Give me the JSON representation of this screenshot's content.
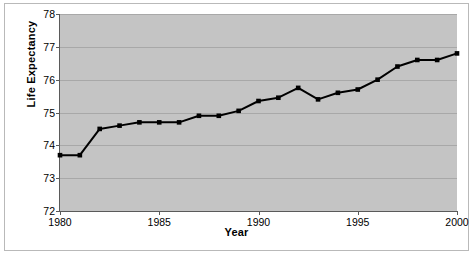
{
  "chart_data": {
    "type": "line",
    "title": "",
    "xlabel": "Year",
    "ylabel": "Life Expectancy",
    "xlim": [
      1980,
      2000
    ],
    "ylim": [
      72,
      78
    ],
    "grid": true,
    "legend": "none",
    "marker": "square",
    "line_color": "#000000",
    "plot_background": "#c4c4c4",
    "gridline_color": "#a8a8a8",
    "x_tick_labels": [
      "1980",
      "1985",
      "1990",
      "1995",
      "2000"
    ],
    "x_tick_values": [
      1980,
      1985,
      1990,
      1995,
      2000
    ],
    "y_tick_labels": [
      "72",
      "73",
      "74",
      "75",
      "76",
      "77",
      "78"
    ],
    "y_tick_values": [
      72,
      73,
      74,
      75,
      76,
      77,
      78
    ],
    "x": [
      1980,
      1981,
      1982,
      1983,
      1984,
      1985,
      1986,
      1987,
      1988,
      1989,
      1990,
      1991,
      1992,
      1993,
      1994,
      1995,
      1996,
      1997,
      1998,
      1999,
      2000
    ],
    "values": [
      73.7,
      73.7,
      74.5,
      74.6,
      74.7,
      74.7,
      74.7,
      74.9,
      74.9,
      75.05,
      75.35,
      75.45,
      75.75,
      75.4,
      75.6,
      75.7,
      76.0,
      76.4,
      76.6,
      76.6,
      76.8
    ]
  },
  "caption": ""
}
